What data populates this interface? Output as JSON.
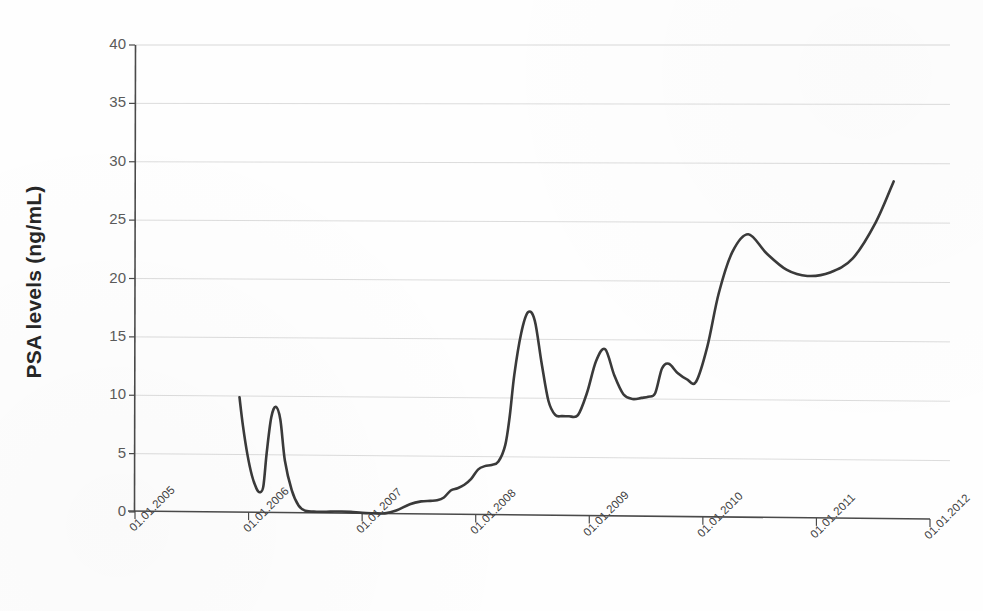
{
  "chart_data": {
    "type": "line",
    "title": "",
    "subtitle": "",
    "xlabel": "",
    "ylabel": "PSA levels (ng/mL)",
    "ylim": [
      0,
      40
    ],
    "xlim": [
      "01.01.2005",
      "01.01.2012"
    ],
    "grid": true,
    "legend": null,
    "y_ticks": [
      0,
      5,
      10,
      15,
      20,
      25,
      30,
      35,
      40
    ],
    "y_tick_labels": [
      "0",
      "5",
      "10",
      "15",
      "20",
      "25",
      "30",
      "35",
      "40"
    ],
    "x_tick_labels": [
      "01.01.2005",
      "01.01.2006",
      "01.01.2007",
      "01.01.2008",
      "01.01.2009",
      "01.01.2010",
      "01.01.2011",
      "01.01.2012"
    ],
    "x_tick_values": [
      2005.0,
      2006.0,
      2007.0,
      2008.0,
      2009.0,
      2010.0,
      2011.0,
      2012.0
    ],
    "line_color": "#3a3a3a",
    "grid_color": "#d8d8d8",
    "axis_color": "#4a4a4a",
    "series": [
      {
        "name": "PSA",
        "x": [
          2005.92,
          2005.95,
          2005.99,
          2006.03,
          2006.07,
          2006.1,
          2006.13,
          2006.16,
          2006.2,
          2006.24,
          2006.28,
          2006.32,
          2006.38,
          2006.44,
          2006.5,
          2006.6,
          2006.72,
          2006.82,
          2006.9,
          2007.0,
          2007.1,
          2007.2,
          2007.3,
          2007.42,
          2007.52,
          2007.6,
          2007.66,
          2007.72,
          2007.78,
          2007.84,
          2007.9,
          2007.96,
          2008.02,
          2008.08,
          2008.14,
          2008.2,
          2008.26,
          2008.3,
          2008.34,
          2008.4,
          2008.46,
          2008.52,
          2008.58,
          2008.64,
          2008.7,
          2008.76,
          2008.82,
          2008.9,
          2008.98,
          2009.06,
          2009.14,
          2009.22,
          2009.3,
          2009.38,
          2009.46,
          2009.52,
          2009.58,
          2009.64,
          2009.7,
          2009.78,
          2009.86,
          2009.94,
          2010.04,
          2010.14,
          2010.26,
          2010.4,
          2010.56,
          2010.74,
          2010.92,
          2011.12,
          2011.32,
          2011.52,
          2011.68
        ],
        "y": [
          9.9,
          7.5,
          5.0,
          3.2,
          2.1,
          1.8,
          2.3,
          5.2,
          8.2,
          9.1,
          8.0,
          4.5,
          2.0,
          0.7,
          0.25,
          0.18,
          0.2,
          0.22,
          0.2,
          0.12,
          0.1,
          0.1,
          0.35,
          0.9,
          1.15,
          1.2,
          1.25,
          1.5,
          2.1,
          2.3,
          2.6,
          3.1,
          3.9,
          4.2,
          4.3,
          4.6,
          6.0,
          8.5,
          12.0,
          15.5,
          17.3,
          16.6,
          13.0,
          9.8,
          8.6,
          8.5,
          8.5,
          8.6,
          10.5,
          13.2,
          14.2,
          12.0,
          10.4,
          10.0,
          10.1,
          10.2,
          10.5,
          12.6,
          13.0,
          12.2,
          11.7,
          11.5,
          14.5,
          19.0,
          22.5,
          24.0,
          22.4,
          21.0,
          20.5,
          20.8,
          22.0,
          25.0,
          28.5
        ]
      }
    ],
    "annotations": [],
    "data_notes": "Single PSA time-series curve; nadir near zero from mid-2006 to early 2007, then progressive rise with intermittent spikes to ~17.3, ~14.2, ~24, ending at ~39."
  }
}
